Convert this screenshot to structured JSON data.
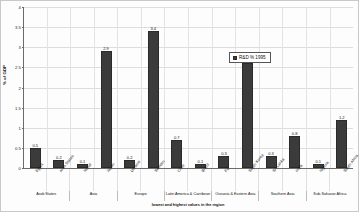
{
  "chart_data": {
    "type": "bar",
    "title": "",
    "xlabel": "lowest and highest values in the region",
    "ylabel": "% of GDP",
    "ylim": [
      0,
      4
    ],
    "yticks": [
      "0",
      "0.5",
      "1",
      "1.5",
      "2",
      "2.5",
      "3",
      "3.5",
      "4"
    ],
    "grid": true,
    "legend": {
      "position": "top-right",
      "entries": [
        {
          "label": "R&D % 1995",
          "color": "#3b3b3b"
        }
      ]
    },
    "categories": [
      "Egypt",
      "Arab States",
      "Nepal",
      "Japan",
      "Ukraine",
      "Sweden",
      "Chile",
      "Brazil",
      "Fiji",
      "South Korea",
      "Sri Lanka",
      "India",
      "Nigeria",
      "South Africa"
    ],
    "values": [
      0.5,
      0.2,
      0.1,
      2.9,
      0.2,
      3.4,
      0.7,
      0.1,
      0.3,
      2.6,
      0.3,
      0.8,
      0.1,
      1.2
    ],
    "value_labels": [
      "0.5",
      "0.2",
      "0.1",
      "2.9",
      "0.2",
      "3.4",
      "0.7",
      "0.1",
      "0.3",
      "2.6",
      "0.3",
      "0.8",
      "0.1",
      "1.2"
    ],
    "groups": [
      {
        "label": "Arab States",
        "span": 2
      },
      {
        "label": "Asia",
        "span": 2
      },
      {
        "label": "Europe",
        "span": 2
      },
      {
        "label": "Latin America & Carribean",
        "span": 2
      },
      {
        "label": "Oceania & Eastern Asia",
        "span": 2
      },
      {
        "label": "Southern Asia",
        "span": 2
      },
      {
        "label": "Sub-Saharan Africa",
        "span": 2
      }
    ],
    "colors": {
      "bar": "#3b3b3b",
      "axis": "#6b6b6b",
      "grid": "#dddddd",
      "text": "#111111"
    }
  }
}
